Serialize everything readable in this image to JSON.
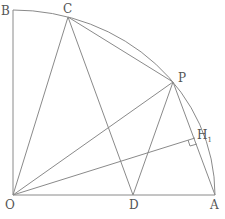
{
  "diagram": {
    "type": "geometry",
    "stroke_color": "#8a8a8a",
    "points": {
      "O": {
        "label": "O",
        "x": 13,
        "y": 195
      },
      "A": {
        "label": "A",
        "x": 215,
        "y": 195
      },
      "B": {
        "label": "B",
        "x": 13,
        "y": 10
      },
      "C": {
        "label": "C",
        "x": 68,
        "y": 17
      },
      "P": {
        "label": "P",
        "x": 173,
        "y": 82
      },
      "D": {
        "label": "D",
        "x": 133,
        "y": 195
      },
      "H1": {
        "label": "H",
        "subscript": "1",
        "x": 195,
        "y": 138
      }
    },
    "segments": [
      [
        "O",
        "B"
      ],
      [
        "O",
        "A"
      ],
      [
        "C",
        "O"
      ],
      [
        "C",
        "D"
      ],
      [
        "C",
        "P"
      ],
      [
        "P",
        "O"
      ],
      [
        "P",
        "D"
      ],
      [
        "P",
        "A"
      ],
      [
        "O",
        "H1"
      ]
    ],
    "arc": {
      "center": "O",
      "from": "A",
      "to": "B"
    },
    "right_angle_at": "H1"
  },
  "labels": {
    "B": "B",
    "C": "C",
    "P": "P",
    "H": "H",
    "H_sub": "1",
    "O": "O",
    "D": "D",
    "A": "A"
  },
  "footer_text": "…"
}
